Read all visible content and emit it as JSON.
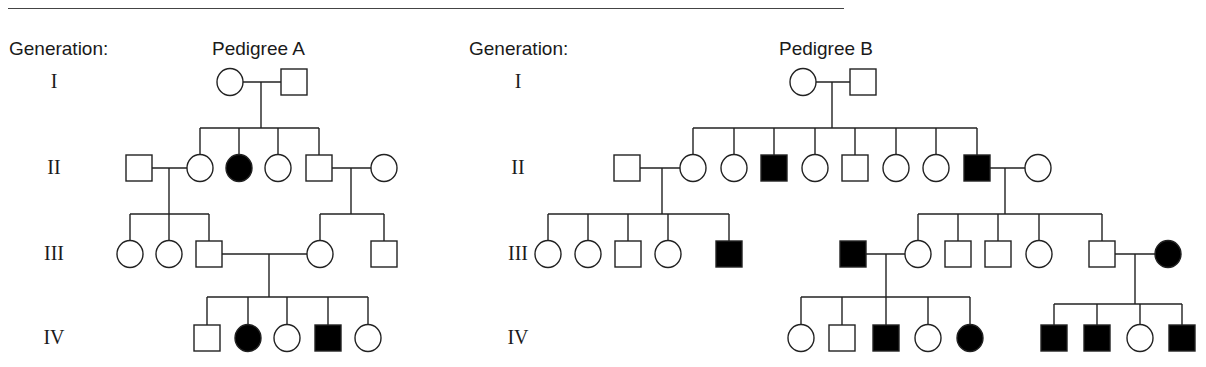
{
  "figure": {
    "caption_rule": true
  },
  "pedigree_a": {
    "generation_header": "Generation:",
    "title": "Pedigree A",
    "generations": [
      {
        "label": "I",
        "y": 82
      },
      {
        "label": "II",
        "y": 168
      },
      {
        "label": "III",
        "y": 254
      },
      {
        "label": "IV",
        "y": 338
      }
    ]
  },
  "pedigree_b": {
    "generation_header": "Generation:",
    "title": "Pedigree B",
    "generations": [
      {
        "label": "I",
        "y": 82
      },
      {
        "label": "II",
        "y": 168
      },
      {
        "label": "III",
        "y": 254
      },
      {
        "label": "IV",
        "y": 338
      }
    ]
  },
  "legend_semantics": {
    "circle": "female",
    "square": "male",
    "filled": "affected",
    "open": "unaffected"
  },
  "individuals": [
    {
      "ped": "A",
      "gen": "I",
      "sex": "F",
      "affected": false,
      "x": 230,
      "y": 82
    },
    {
      "ped": "A",
      "gen": "I",
      "sex": "M",
      "affected": false,
      "x": 294,
      "y": 82
    },
    {
      "ped": "A",
      "gen": "II",
      "sex": "M",
      "affected": false,
      "x": 139,
      "y": 168
    },
    {
      "ped": "A",
      "gen": "II",
      "sex": "F",
      "affected": false,
      "x": 200,
      "y": 168
    },
    {
      "ped": "A",
      "gen": "II",
      "sex": "F",
      "affected": true,
      "x": 239,
      "y": 168
    },
    {
      "ped": "A",
      "gen": "II",
      "sex": "F",
      "affected": false,
      "x": 278,
      "y": 168
    },
    {
      "ped": "A",
      "gen": "II",
      "sex": "M",
      "affected": false,
      "x": 319,
      "y": 168
    },
    {
      "ped": "A",
      "gen": "II",
      "sex": "F",
      "affected": false,
      "x": 384,
      "y": 168
    },
    {
      "ped": "A",
      "gen": "III",
      "sex": "F",
      "affected": false,
      "x": 130,
      "y": 254
    },
    {
      "ped": "A",
      "gen": "III",
      "sex": "F",
      "affected": false,
      "x": 169,
      "y": 254
    },
    {
      "ped": "A",
      "gen": "III",
      "sex": "M",
      "affected": false,
      "x": 209,
      "y": 254
    },
    {
      "ped": "A",
      "gen": "III",
      "sex": "F",
      "affected": false,
      "x": 320,
      "y": 254
    },
    {
      "ped": "A",
      "gen": "III",
      "sex": "M",
      "affected": false,
      "x": 384,
      "y": 254
    },
    {
      "ped": "A",
      "gen": "IV",
      "sex": "M",
      "affected": false,
      "x": 207,
      "y": 338
    },
    {
      "ped": "A",
      "gen": "IV",
      "sex": "F",
      "affected": true,
      "x": 248,
      "y": 338
    },
    {
      "ped": "A",
      "gen": "IV",
      "sex": "F",
      "affected": false,
      "x": 287,
      "y": 338
    },
    {
      "ped": "A",
      "gen": "IV",
      "sex": "M",
      "affected": true,
      "x": 328,
      "y": 338
    },
    {
      "ped": "A",
      "gen": "IV",
      "sex": "F",
      "affected": false,
      "x": 368,
      "y": 338
    },
    {
      "ped": "B",
      "gen": "I",
      "sex": "F",
      "affected": false,
      "x": 803,
      "y": 82
    },
    {
      "ped": "B",
      "gen": "I",
      "sex": "M",
      "affected": false,
      "x": 863,
      "y": 82
    },
    {
      "ped": "B",
      "gen": "II",
      "sex": "M",
      "affected": false,
      "x": 627,
      "y": 168
    },
    {
      "ped": "B",
      "gen": "II",
      "sex": "F",
      "affected": false,
      "x": 693,
      "y": 168
    },
    {
      "ped": "B",
      "gen": "II",
      "sex": "F",
      "affected": false,
      "x": 734,
      "y": 168
    },
    {
      "ped": "B",
      "gen": "II",
      "sex": "M",
      "affected": true,
      "x": 774,
      "y": 168
    },
    {
      "ped": "B",
      "gen": "II",
      "sex": "F",
      "affected": false,
      "x": 815,
      "y": 168
    },
    {
      "ped": "B",
      "gen": "II",
      "sex": "M",
      "affected": false,
      "x": 855,
      "y": 168
    },
    {
      "ped": "B",
      "gen": "II",
      "sex": "F",
      "affected": false,
      "x": 896,
      "y": 168
    },
    {
      "ped": "B",
      "gen": "II",
      "sex": "F",
      "affected": false,
      "x": 936,
      "y": 168
    },
    {
      "ped": "B",
      "gen": "II",
      "sex": "M",
      "affected": true,
      "x": 977,
      "y": 168
    },
    {
      "ped": "B",
      "gen": "II",
      "sex": "F",
      "affected": false,
      "x": 1038,
      "y": 168
    },
    {
      "ped": "B",
      "gen": "III",
      "sex": "F",
      "affected": false,
      "x": 548,
      "y": 254
    },
    {
      "ped": "B",
      "gen": "III",
      "sex": "F",
      "affected": false,
      "x": 588,
      "y": 254
    },
    {
      "ped": "B",
      "gen": "III",
      "sex": "M",
      "affected": false,
      "x": 628,
      "y": 254
    },
    {
      "ped": "B",
      "gen": "III",
      "sex": "F",
      "affected": false,
      "x": 668,
      "y": 254
    },
    {
      "ped": "B",
      "gen": "III",
      "sex": "M",
      "affected": true,
      "x": 729,
      "y": 254
    },
    {
      "ped": "B",
      "gen": "III",
      "sex": "M",
      "affected": true,
      "x": 853,
      "y": 254
    },
    {
      "ped": "B",
      "gen": "III",
      "sex": "F",
      "affected": false,
      "x": 918,
      "y": 254
    },
    {
      "ped": "B",
      "gen": "III",
      "sex": "M",
      "affected": false,
      "x": 958,
      "y": 254
    },
    {
      "ped": "B",
      "gen": "III",
      "sex": "M",
      "affected": false,
      "x": 998,
      "y": 254
    },
    {
      "ped": "B",
      "gen": "III",
      "sex": "F",
      "affected": false,
      "x": 1039,
      "y": 254
    },
    {
      "ped": "B",
      "gen": "III",
      "sex": "M",
      "affected": false,
      "x": 1102,
      "y": 254
    },
    {
      "ped": "B",
      "gen": "III",
      "sex": "F",
      "affected": true,
      "x": 1168,
      "y": 254
    },
    {
      "ped": "B",
      "gen": "IV",
      "sex": "F",
      "affected": false,
      "x": 801,
      "y": 338
    },
    {
      "ped": "B",
      "gen": "IV",
      "sex": "M",
      "affected": false,
      "x": 842,
      "y": 338
    },
    {
      "ped": "B",
      "gen": "IV",
      "sex": "M",
      "affected": true,
      "x": 886,
      "y": 338
    },
    {
      "ped": "B",
      "gen": "IV",
      "sex": "F",
      "affected": false,
      "x": 928,
      "y": 338
    },
    {
      "ped": "B",
      "gen": "IV",
      "sex": "F",
      "affected": true,
      "x": 970,
      "y": 338
    },
    {
      "ped": "B",
      "gen": "IV",
      "sex": "M",
      "affected": true,
      "x": 1054,
      "y": 338
    },
    {
      "ped": "B",
      "gen": "IV",
      "sex": "M",
      "affected": true,
      "x": 1097,
      "y": 338
    },
    {
      "ped": "B",
      "gen": "IV",
      "sex": "F",
      "affected": false,
      "x": 1140,
      "y": 338
    },
    {
      "ped": "B",
      "gen": "IV",
      "sex": "M",
      "affected": true,
      "x": 1182,
      "y": 338
    }
  ],
  "lines": [
    [
      243,
      82,
      281,
      82
    ],
    [
      261,
      82,
      261,
      128
    ],
    [
      200,
      128,
      319,
      128
    ],
    [
      200,
      128,
      200,
      155
    ],
    [
      239,
      128,
      239,
      155
    ],
    [
      278,
      128,
      278,
      155
    ],
    [
      319,
      128,
      319,
      155
    ],
    [
      152,
      168,
      187,
      168
    ],
    [
      169,
      168,
      169,
      214
    ],
    [
      130,
      214,
      209,
      214
    ],
    [
      130,
      214,
      130,
      241
    ],
    [
      169,
      214,
      169,
      241
    ],
    [
      209,
      214,
      209,
      241
    ],
    [
      332,
      168,
      371,
      168
    ],
    [
      351,
      168,
      351,
      214
    ],
    [
      320,
      214,
      384,
      214
    ],
    [
      320,
      214,
      320,
      241
    ],
    [
      384,
      214,
      384,
      241
    ],
    [
      222,
      254,
      307,
      254
    ],
    [
      269,
      254,
      269,
      297
    ],
    [
      207,
      297,
      368,
      297
    ],
    [
      207,
      297,
      207,
      325
    ],
    [
      248,
      297,
      248,
      325
    ],
    [
      287,
      297,
      287,
      325
    ],
    [
      328,
      297,
      328,
      325
    ],
    [
      368,
      297,
      368,
      325
    ],
    [
      816,
      82,
      850,
      82
    ],
    [
      832,
      82,
      832,
      128
    ],
    [
      693,
      128,
      977,
      128
    ],
    [
      693,
      128,
      693,
      155
    ],
    [
      734,
      128,
      734,
      155
    ],
    [
      774,
      128,
      774,
      155
    ],
    [
      815,
      128,
      815,
      155
    ],
    [
      855,
      128,
      855,
      155
    ],
    [
      896,
      128,
      896,
      155
    ],
    [
      936,
      128,
      936,
      155
    ],
    [
      977,
      128,
      977,
      155
    ],
    [
      640,
      168,
      680,
      168
    ],
    [
      662,
      168,
      662,
      214
    ],
    [
      548,
      214,
      729,
      214
    ],
    [
      548,
      214,
      548,
      241
    ],
    [
      588,
      214,
      588,
      241
    ],
    [
      628,
      214,
      628,
      241
    ],
    [
      668,
      214,
      668,
      241
    ],
    [
      729,
      214,
      729,
      241
    ],
    [
      990,
      168,
      1025,
      168
    ],
    [
      1005,
      168,
      1005,
      214
    ],
    [
      918,
      214,
      1102,
      214
    ],
    [
      918,
      214,
      918,
      241
    ],
    [
      958,
      214,
      958,
      241
    ],
    [
      998,
      214,
      998,
      241
    ],
    [
      1039,
      214,
      1039,
      241
    ],
    [
      1102,
      214,
      1102,
      241
    ],
    [
      866,
      254,
      905,
      254
    ],
    [
      886,
      254,
      886,
      297
    ],
    [
      801,
      297,
      970,
      297
    ],
    [
      801,
      297,
      801,
      325
    ],
    [
      842,
      297,
      842,
      325
    ],
    [
      886,
      297,
      886,
      325
    ],
    [
      928,
      297,
      928,
      325
    ],
    [
      970,
      297,
      970,
      325
    ],
    [
      1115,
      254,
      1155,
      254
    ],
    [
      1135,
      254,
      1135,
      304
    ],
    [
      1054,
      304,
      1182,
      304
    ],
    [
      1054,
      304,
      1054,
      325
    ],
    [
      1097,
      304,
      1097,
      325
    ],
    [
      1140,
      304,
      1140,
      325
    ],
    [
      1182,
      304,
      1182,
      325
    ]
  ]
}
